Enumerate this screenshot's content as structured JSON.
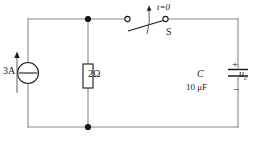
{
  "diagram": {
    "type": "electrical-schematic",
    "background_color": "#ffffff",
    "wire_color": "#8a8a8a",
    "symbol_color": "#1b1b1b",
    "labels": {
      "current_source": "3A",
      "resistor": "2Ω",
      "switch_time": "t=0",
      "switch_name": "S",
      "capacitor": "C",
      "capacitor_value": "10 μF",
      "polarity_plus": "+",
      "polarity_minus": "−",
      "capacitor_voltage": "u",
      "capacitor_voltage_sub": "c"
    },
    "components": [
      {
        "id": "current-source",
        "kind": "current-source",
        "value": "3A",
        "position": "left-branch"
      },
      {
        "id": "resistor",
        "kind": "resistor",
        "value": "2Ω",
        "position": "middle-branch"
      },
      {
        "id": "switch",
        "kind": "spst-switch",
        "state": "open",
        "label": "S",
        "note": "t=0",
        "position": "top-branch"
      },
      {
        "id": "capacitor",
        "kind": "capacitor",
        "value": "10 μF",
        "label": "C",
        "voltage": "u_c",
        "position": "right-branch"
      }
    ],
    "nodes": [
      {
        "id": "top-node",
        "x": 88,
        "y": 19
      },
      {
        "id": "bottom-node",
        "x": 88,
        "y": 127
      }
    ]
  }
}
